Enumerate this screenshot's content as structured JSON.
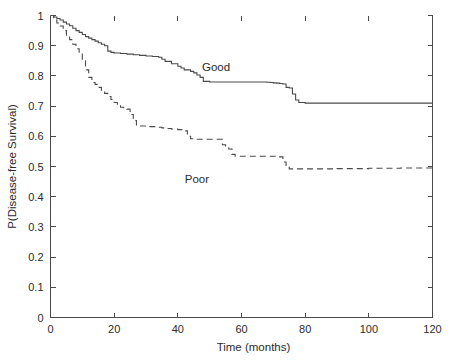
{
  "chart_data": {
    "type": "line",
    "title": "",
    "subtitle": "",
    "xlabel": "Time (months)",
    "ylabel": "P(Disease-free Survival)",
    "xlim": [
      0,
      120
    ],
    "ylim": [
      0,
      1
    ],
    "xticks": [
      "0",
      "20",
      "40",
      "60",
      "80",
      "100",
      "120"
    ],
    "xtick_values": [
      0,
      20,
      40,
      60,
      80,
      100,
      120
    ],
    "yticks": [
      "0",
      "0.1",
      "0.2",
      "0.3",
      "0.4",
      "0.5",
      "0.6",
      "0.7",
      "0.8",
      "0.9",
      "1"
    ],
    "ytick_values": [
      0,
      0.1,
      0.2,
      0.3,
      0.4,
      0.5,
      0.6,
      0.7,
      0.8,
      0.9,
      1
    ],
    "grid": false,
    "legend_position": "inline-annotation",
    "style": "step",
    "axis_color": "#4a4a4a",
    "text_color": "#2b2b2b",
    "background": "#ffffff",
    "series": [
      {
        "name": "Good",
        "linestyle": "solid",
        "color": "#4a4a4a",
        "label_x": 52,
        "label_y": 0.815,
        "x": [
          0,
          1,
          2,
          3,
          4,
          5,
          6,
          7,
          8,
          9,
          10,
          11,
          12,
          13,
          14,
          15,
          16,
          17,
          18,
          19,
          20,
          22,
          24,
          26,
          28,
          30,
          32,
          34,
          35,
          36,
          38,
          40,
          41,
          42,
          44,
          45,
          46,
          47,
          48,
          50,
          55,
          60,
          65,
          67,
          68,
          69,
          70,
          71,
          72,
          73,
          74,
          75,
          76,
          77,
          78,
          80,
          85,
          90,
          95,
          100,
          105,
          110,
          115,
          120
        ],
        "y": [
          1.0,
          0.995,
          0.99,
          0.985,
          0.978,
          0.972,
          0.966,
          0.958,
          0.95,
          0.944,
          0.937,
          0.93,
          0.925,
          0.92,
          0.915,
          0.91,
          0.905,
          0.9,
          0.882,
          0.878,
          0.876,
          0.874,
          0.872,
          0.87,
          0.868,
          0.866,
          0.864,
          0.862,
          0.855,
          0.848,
          0.84,
          0.832,
          0.826,
          0.82,
          0.815,
          0.81,
          0.803,
          0.795,
          0.782,
          0.78,
          0.78,
          0.78,
          0.78,
          0.78,
          0.779,
          0.778,
          0.777,
          0.776,
          0.775,
          0.773,
          0.762,
          0.76,
          0.74,
          0.72,
          0.712,
          0.71,
          0.71,
          0.71,
          0.71,
          0.71,
          0.71,
          0.71,
          0.71,
          0.71
        ]
      },
      {
        "name": "Poor",
        "linestyle": "dashed",
        "color": "#4a4a4a",
        "label_x": 46,
        "label_y": 0.445,
        "x": [
          0,
          1,
          2,
          3,
          4,
          5,
          6,
          7,
          8,
          9,
          10,
          11,
          12,
          13,
          14,
          15,
          16,
          17,
          18,
          19,
          20,
          21,
          22,
          23,
          24,
          25,
          26,
          27,
          30,
          33,
          35,
          36,
          38,
          40,
          42,
          43,
          44,
          45,
          46,
          48,
          50,
          52,
          53,
          54,
          55,
          56,
          57,
          58,
          60,
          62,
          64,
          66,
          68,
          70,
          71,
          72,
          73,
          74,
          75,
          80,
          85,
          90,
          95,
          100,
          105,
          110,
          115,
          120
        ],
        "y": [
          1.0,
          0.985,
          0.975,
          0.965,
          0.95,
          0.935,
          0.92,
          0.905,
          0.89,
          0.872,
          0.85,
          0.82,
          0.795,
          0.778,
          0.772,
          0.762,
          0.752,
          0.742,
          0.732,
          0.722,
          0.712,
          0.702,
          0.696,
          0.692,
          0.69,
          0.672,
          0.652,
          0.634,
          0.632,
          0.63,
          0.628,
          0.626,
          0.624,
          0.622,
          0.618,
          0.6,
          0.592,
          0.59,
          0.59,
          0.59,
          0.59,
          0.59,
          0.59,
          0.572,
          0.562,
          0.558,
          0.54,
          0.534,
          0.534,
          0.534,
          0.534,
          0.534,
          0.534,
          0.534,
          0.533,
          0.532,
          0.515,
          0.497,
          0.492,
          0.492,
          0.492,
          0.493,
          0.493,
          0.494,
          0.494,
          0.495,
          0.495,
          0.495
        ]
      }
    ]
  }
}
